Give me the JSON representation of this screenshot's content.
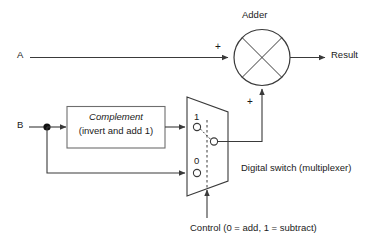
{
  "diagram": {
    "title_adder": "Adder",
    "inputs": {
      "a": "A",
      "b": "B"
    },
    "output": "Result",
    "complement_box": {
      "line1": "Complement",
      "line2": "(invert and add 1)"
    },
    "mux": {
      "input_label_1": "1",
      "input_label_0": "0",
      "caption": "Digital switch (multiplexer)"
    },
    "control": {
      "label": "Control (0 = add, 1 = subtract)"
    },
    "adder_signs": {
      "top": "+",
      "bottom": "+"
    },
    "colors": {
      "line": "#3a3a3a",
      "box_border": "#6e6e6e",
      "text": "#1a1a1a",
      "background": "#ffffff"
    }
  }
}
